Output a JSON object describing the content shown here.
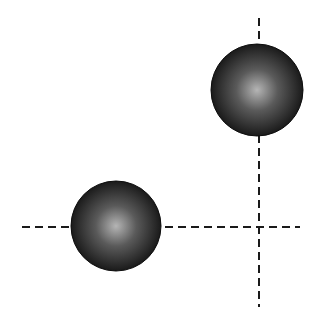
{
  "diagram": {
    "background": "#ffffff",
    "line_color": "#1a1a1a",
    "sphere_edge_color": "#0d0d0d",
    "sphere_highlight_color": "#b5b5b5",
    "sphere_mid_color": "#5a5a5a",
    "sphere_dark_color": "#1a1a1a",
    "lines": [
      {
        "name": "horizontal-dashed-line",
        "x1": 22,
        "y1": 227,
        "x2": 300,
        "y2": 227
      },
      {
        "name": "vertical-dashed-line",
        "x1": 259,
        "y1": 18,
        "x2": 259,
        "y2": 307
      }
    ],
    "spheres": [
      {
        "name": "upper-right-sphere",
        "cx": 257,
        "cy": 90,
        "r": 46
      },
      {
        "name": "lower-left-sphere",
        "cx": 116,
        "cy": 226,
        "r": 45
      }
    ]
  }
}
